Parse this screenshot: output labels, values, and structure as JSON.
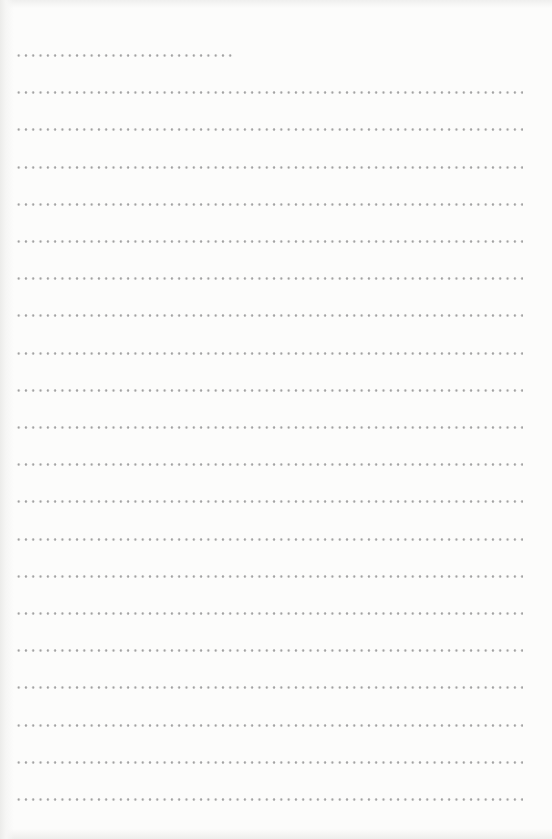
{
  "document": {
    "type": "dotted-line writing paper",
    "line_count": 21,
    "first_line": {
      "top": 54,
      "length": 218,
      "style": "short"
    },
    "full_lines": {
      "count": 20,
      "length": 508
    },
    "line_spacing": 37.2,
    "dot_spacing": 7.3,
    "colors": {
      "paper": "#fcfcfb",
      "dots": "#a4a4a4"
    }
  }
}
